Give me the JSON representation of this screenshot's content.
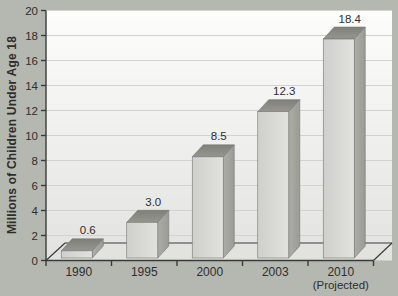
{
  "figure": {
    "background_color": "#b5b8b1",
    "plot_background_top": "#fdfdfc",
    "plot_background_bottom": "#e2e2df"
  },
  "chart_data": {
    "type": "bar",
    "style": "3d-bars",
    "title": "",
    "xlabel": "",
    "ylabel": "Millions of Children Under Age 18",
    "ylim": [
      0,
      20
    ],
    "ytick_interval": 2,
    "yticks": [
      "0",
      "2",
      "4",
      "6",
      "8",
      "10",
      "12",
      "14",
      "16",
      "18",
      "20"
    ],
    "grid": true,
    "legend": "none",
    "categories": [
      "1990",
      "1995",
      "2000",
      "2003",
      "2010"
    ],
    "category_sublabels": [
      "",
      "",
      "",
      "",
      "(Projected)"
    ],
    "values": [
      0.6,
      3.0,
      8.5,
      12.3,
      18.4
    ],
    "bar_labels": [
      "0.6",
      "3.0",
      "8.5",
      "12.3",
      "18.4"
    ],
    "colors": {
      "bar_front_left": "#cfcfcb",
      "bar_front_right": "#e1e1dd",
      "bar_top_front": "#96968f",
      "bar_top_back": "#80807b",
      "bar_side_left": "#adada8",
      "bar_side_right": "#9b9b96",
      "bar_edge": "#767672",
      "axis": "#3b3b3b",
      "gridline": "#d2d2cf",
      "text": "#2e2e2c"
    }
  }
}
